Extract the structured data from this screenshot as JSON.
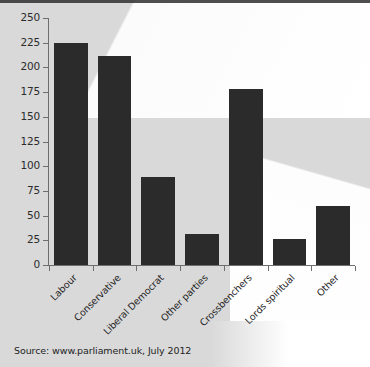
{
  "chart_data": {
    "type": "bar",
    "title": "",
    "xlabel": "",
    "ylabel": "",
    "ylim": [
      0,
      250
    ],
    "yticks": [
      0,
      25,
      50,
      75,
      100,
      125,
      150,
      175,
      200,
      225,
      250
    ],
    "grid": false,
    "legend": null,
    "bar_color": "#2b2b2b",
    "categories": [
      "Labour",
      "Conservative",
      "Liberal Democrat",
      "Other parties",
      "Crossbenchers",
      "Lords spiritual",
      "Other"
    ],
    "values": [
      225,
      212,
      89,
      31,
      178,
      26,
      60
    ]
  },
  "source": {
    "text": "Source: www.parliament.uk, July 2012"
  }
}
